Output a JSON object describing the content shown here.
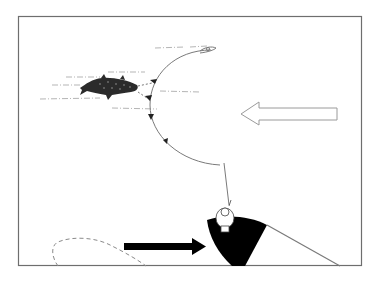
{
  "diagram": {
    "colors": {
      "background": "#ffffff",
      "frame": "#6e6e6e",
      "line": "#7a7a7a",
      "boat": "#000000",
      "fish": "#2b2b2b",
      "outline_arrow": "#9a9a9a",
      "solid_arrow": "#000000",
      "dashed_path": "#8a8a8a",
      "water_streaks": "#b5b5b5"
    },
    "elements": {
      "frame": "frame",
      "fish": "leaping-fish",
      "fishing_line": "line-arc",
      "direction_arrows_count": 4,
      "lure": "lure",
      "angler": "angler-figure",
      "boat": "boat",
      "wake": "boat-wake-line",
      "outline_arrow_direction": "left",
      "solid_arrow_direction": "right",
      "dashed_path": "drift-path"
    }
  }
}
